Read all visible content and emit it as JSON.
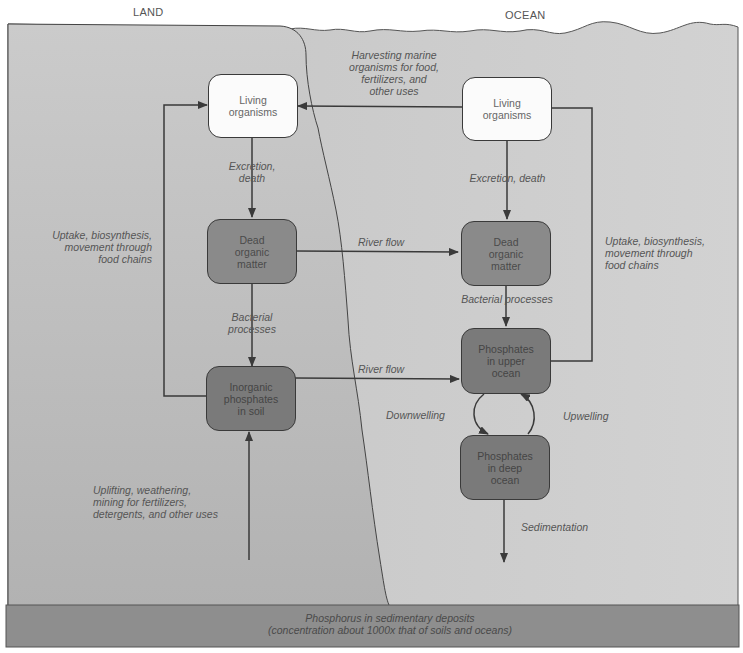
{
  "regions": {
    "land": "LAND",
    "ocean": "OCEAN"
  },
  "colors": {
    "land_fill": "#bdbdbd",
    "ocean_fill": "#cfcfcf",
    "sediment_fill": "#8e8e8e",
    "light_box": "#fbfbfb",
    "mid_box": "#8a8a8a",
    "dark_box": "#7a7a7a",
    "line": "#3a3a3a"
  },
  "nodes": {
    "land_living": "Living\norganisms",
    "land_dead": "Dead\norganic\nmatter",
    "land_inorganic": "Inorganic\nphosphates\nin soil",
    "ocean_living": "Living\norganisms",
    "ocean_dead": "Dead\norganic\nmatter",
    "ocean_upper": "Phosphates\nin upper\nocean",
    "ocean_deep": "Phosphates\nin deep\nocean"
  },
  "flows": {
    "harvesting": "Harvesting marine\norganisms for food,\nfertilizers, and\nother uses",
    "land_excretion": "Excretion,\ndeath",
    "ocean_excretion": "Excretion, death",
    "land_uptake": "Uptake, biosynthesis,\nmovement through\nfood chains",
    "ocean_uptake": "Uptake, biosynthesis,\nmovement through\nfood chains",
    "river_flow_1": "River flow",
    "river_flow_2": "River flow",
    "land_bacterial": "Bacterial\nprocesses",
    "ocean_bacterial": "Bacterial processes",
    "downwelling": "Downwelling",
    "upwelling": "Upwelling",
    "uplifting": "Uplifting, weathering,\nmining for fertilizers,\ndetergents, and other uses",
    "sedimentation": "Sedimentation"
  },
  "sediment": {
    "line1": "Phosphorus in sedimentary deposits",
    "line2": "(concentration about 1000x that of soils and oceans)"
  }
}
